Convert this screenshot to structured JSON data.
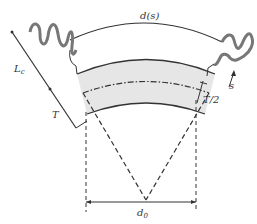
{
  "figure": {
    "labels": {
      "arc_length": "d(s)",
      "contour_length": "L",
      "contour_length_sub": "c",
      "thickness": "T",
      "half_thickness": "T/2",
      "arc_coordinate": "s",
      "base_distance": "d",
      "base_distance_sub": "0"
    },
    "colors": {
      "line": "#333333",
      "band_fill": "#e6e6e6",
      "wave": "#777777"
    }
  }
}
